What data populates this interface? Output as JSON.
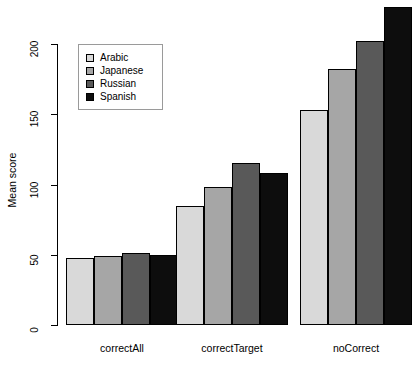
{
  "chart_data": {
    "type": "bar",
    "title": "",
    "xlabel": "",
    "ylabel": "Mean score",
    "categories": [
      "correctAll",
      "correctTarget",
      "noCorrect"
    ],
    "series": [
      {
        "name": "Arabic",
        "color": "#d9d9d9",
        "values": [
          48,
          85,
          153
        ]
      },
      {
        "name": "Japanese",
        "color": "#a6a6a6",
        "values": [
          49,
          98,
          182
        ]
      },
      {
        "name": "Russian",
        "color": "#595959",
        "values": [
          51,
          115,
          202
        ]
      },
      {
        "name": "Spanish",
        "color": "#0d0d0d",
        "values": [
          50,
          108,
          226
        ]
      }
    ],
    "ylim": [
      0,
      230
    ],
    "yticks": [
      0,
      50,
      100,
      150,
      200
    ],
    "ytick_labels": [
      "0",
      "50",
      "100",
      "150",
      "200"
    ],
    "grid": false,
    "legend_position": "top-left",
    "legend_entries": [
      "Arabic",
      "Japanese",
      "Russian",
      "Spanish"
    ]
  }
}
